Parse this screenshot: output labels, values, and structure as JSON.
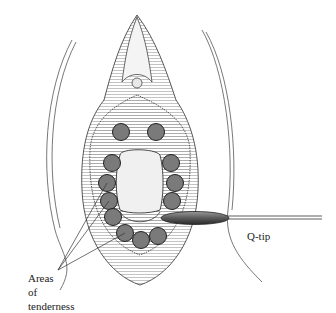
{
  "figure": {
    "type": "anatomical line illustration",
    "labels": {
      "qtip": "Q-tip",
      "areas_line1": "Areas",
      "areas_line2": "of",
      "areas_line3": "tenderness"
    },
    "colors": {
      "ink": "#333333",
      "circle_fill": "#7a7a7a",
      "qtip_fill": "#6a6a6a",
      "background": "#ffffff"
    },
    "tender_points": [
      {
        "x": 121,
        "y": 132
      },
      {
        "x": 156,
        "y": 132
      },
      {
        "x": 112,
        "y": 163
      },
      {
        "x": 107,
        "y": 183
      },
      {
        "x": 109,
        "y": 201
      },
      {
        "x": 113,
        "y": 217
      },
      {
        "x": 125,
        "y": 233
      },
      {
        "x": 141,
        "y": 240
      },
      {
        "x": 158,
        "y": 236
      },
      {
        "x": 171,
        "y": 163
      },
      {
        "x": 175,
        "y": 183
      },
      {
        "x": 172,
        "y": 201
      }
    ]
  }
}
